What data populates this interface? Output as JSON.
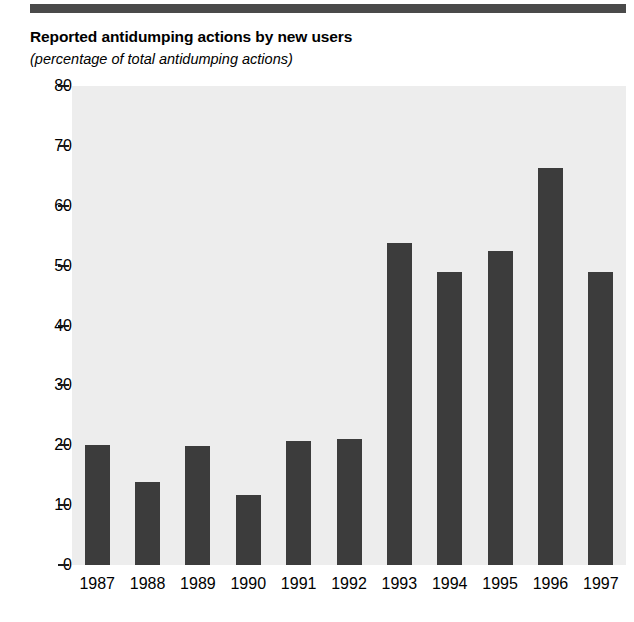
{
  "figure": {
    "title": "Reported antidumping actions by new users",
    "subtitle": "(percentage of total antidumping actions)",
    "bar_color": "#3c3c3c",
    "plot_background": "#ededed",
    "rule_color": "#4a4a4a"
  },
  "chart_data": {
    "type": "bar",
    "title": "Reported antidumping actions by new users",
    "subtitle": "(percentage of total antidumping actions)",
    "xlabel": "",
    "ylabel": "(percentage of total antidumping actions)",
    "categories": [
      "1987",
      "1988",
      "1989",
      "1990",
      "1991",
      "1992",
      "1993",
      "1994",
      "1995",
      "1996",
      "1997"
    ],
    "values": [
      20.0,
      13.8,
      19.8,
      11.7,
      20.7,
      21.0,
      53.8,
      48.9,
      52.5,
      66.3,
      48.9
    ],
    "ylim": [
      0,
      80
    ],
    "yticks": [
      0,
      10,
      20,
      30,
      40,
      50,
      60,
      70,
      80
    ],
    "ytick_labels": [
      "0",
      "10",
      "20",
      "30",
      "40",
      "50",
      "60",
      "70",
      "80"
    ],
    "grid": false,
    "legend": null,
    "legend_position": "none",
    "series": [
      {
        "name": "Reported antidumping actions by new users",
        "values": [
          20.0,
          13.8,
          19.8,
          11.7,
          20.7,
          21.0,
          53.8,
          48.9,
          52.5,
          66.3,
          48.9
        ]
      }
    ]
  }
}
